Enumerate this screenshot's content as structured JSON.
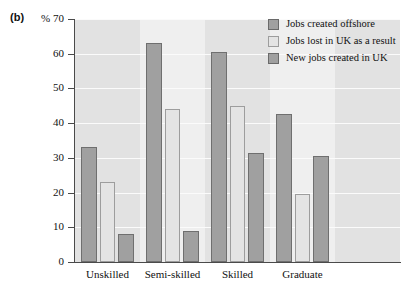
{
  "figure": {
    "panel_label": "(b)",
    "unit_label": "%"
  },
  "chart_data": {
    "type": "bar",
    "title": "",
    "xlabel": "",
    "ylabel": "%",
    "ylim": [
      0,
      70
    ],
    "yticks": [
      0,
      10,
      20,
      30,
      40,
      50,
      60,
      70
    ],
    "grid": true,
    "legend_position": "top-right",
    "categories": [
      "Unskilled",
      "Semi-skilled",
      "Skilled",
      "Graduate"
    ],
    "series": [
      {
        "name": "Jobs created offshore",
        "color": "#a0a0a0",
        "values": [
          33,
          63,
          60.5,
          42.5
        ]
      },
      {
        "name": "Jobs lost in UK as a result",
        "color": "#e4e4e4",
        "values": [
          23,
          44,
          45,
          19.5
        ]
      },
      {
        "name": "New jobs created in UK",
        "color": "#a0a0a0",
        "values": [
          8,
          9,
          31.5,
          30.5
        ]
      }
    ]
  }
}
